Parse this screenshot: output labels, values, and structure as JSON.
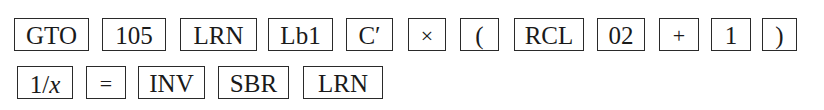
{
  "keystroke_sequence": {
    "row1": [
      {
        "label": "GTO"
      },
      {
        "label": "105"
      },
      {
        "label": "LRN"
      },
      {
        "label": "Lb1"
      },
      {
        "label": "C′"
      },
      {
        "label": "×"
      },
      {
        "label": "("
      },
      {
        "label": "RCL"
      },
      {
        "label": "02"
      },
      {
        "label": "+"
      },
      {
        "label": "1"
      },
      {
        "label": ")"
      }
    ],
    "row2": [
      {
        "label_num": "1/",
        "label_var": "x"
      },
      {
        "label": "="
      },
      {
        "label": "INV"
      },
      {
        "label": "SBR"
      },
      {
        "label": "LRN"
      }
    ]
  }
}
